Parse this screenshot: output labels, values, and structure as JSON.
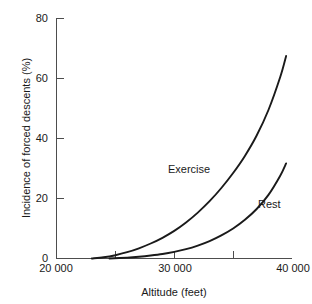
{
  "chart_data": {
    "type": "line",
    "title": "",
    "xlabel": "Altitude (feet)",
    "ylabel": "Incidence of forced descents (%)",
    "xlim": [
      20000,
      40000
    ],
    "ylim": [
      0,
      80
    ],
    "grid": false,
    "legend_position": "inline-annotations",
    "x_major_ticks": [
      20000,
      30000,
      40000
    ],
    "x_major_tick_labels": [
      "20 000",
      "30 000",
      "40 000"
    ],
    "x_minor_ticks": [
      25000,
      35000
    ],
    "y_ticks": [
      0,
      20,
      40,
      60,
      80
    ],
    "y_tick_labels": [
      "0",
      "20",
      "40",
      "60",
      "80"
    ],
    "series": [
      {
        "name": "Exercise",
        "color": "#1a1a1a",
        "x": [
          23000,
          24000,
          25000,
          26000,
          27000,
          28000,
          29000,
          30000,
          31000,
          32000,
          33000,
          34000,
          35000,
          36000,
          37000,
          38000,
          39000,
          39500
        ],
        "values": [
          0,
          0.4,
          1.1,
          2.1,
          3.4,
          5.0,
          6.9,
          9.2,
          12.0,
          15.3,
          19.1,
          23.5,
          28.5,
          34.2,
          41.0,
          49.5,
          60.5,
          67.5
        ]
      },
      {
        "name": "Rest",
        "color": "#1a1a1a",
        "x": [
          24500,
          26000,
          27000,
          28000,
          29000,
          30000,
          31000,
          32000,
          33000,
          34000,
          35000,
          36000,
          37000,
          38000,
          39000,
          39500
        ],
        "values": [
          0,
          0.3,
          0.6,
          1.0,
          1.5,
          2.2,
          3.1,
          4.3,
          5.8,
          7.7,
          10.0,
          12.9,
          16.5,
          21.2,
          27.6,
          31.7
        ]
      }
    ],
    "annotations": [
      {
        "text": "Exercise",
        "x": 27000,
        "y": 32
      },
      {
        "text": "Rest",
        "x": 36500,
        "y": 20
      }
    ]
  },
  "axes": {
    "y_labels": {
      "t0": "0",
      "t20": "20",
      "t40": "40",
      "t60": "60",
      "t80": "80"
    },
    "x_labels": {
      "t20000": "20 000",
      "t30000": "30 000",
      "t40000": "40 000"
    },
    "x_title": "Altitude (feet)",
    "y_title": "Incidence of forced descents (%)"
  },
  "labels": {
    "exercise": "Exercise",
    "rest": "Rest"
  },
  "colors": {
    "axis": "#4d4d4d",
    "curve": "#1a1a1a",
    "text": "#1a1a1a",
    "background": "#ffffff"
  }
}
